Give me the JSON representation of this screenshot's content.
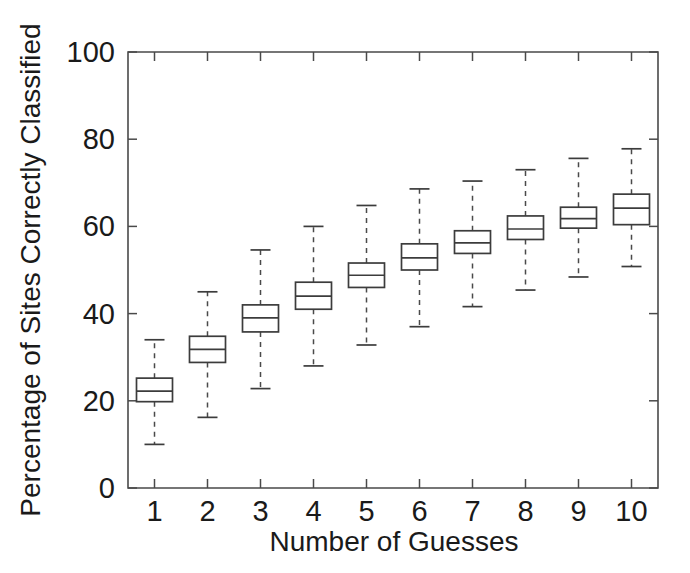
{
  "chart_data": {
    "type": "box",
    "title": "",
    "xlabel": "Number of Guesses",
    "ylabel": "Percentage of Sites Correctly Classified",
    "xlim": [
      0.5,
      10.5
    ],
    "ylim": [
      0,
      100
    ],
    "grid": false,
    "legend": "none",
    "x_tick_labels": [
      "1",
      "2",
      "3",
      "4",
      "5",
      "6",
      "7",
      "8",
      "9",
      "10"
    ],
    "y_tick_labels": [
      "0",
      "20",
      "40",
      "60",
      "80",
      "100"
    ],
    "y_ticks": [
      0,
      20,
      40,
      60,
      80,
      100
    ],
    "categories": [
      "1",
      "2",
      "3",
      "4",
      "5",
      "6",
      "7",
      "8",
      "9",
      "10"
    ],
    "boxes": [
      {
        "category": "1",
        "whisker_low": 10.0,
        "q1": 19.8,
        "median": 22.2,
        "q3": 25.2,
        "whisker_high": 34.0
      },
      {
        "category": "2",
        "whisker_low": 16.2,
        "q1": 28.8,
        "median": 31.8,
        "q3": 34.8,
        "whisker_high": 45.0
      },
      {
        "category": "3",
        "whisker_low": 22.8,
        "q1": 35.8,
        "median": 39.0,
        "q3": 42.0,
        "whisker_high": 54.6
      },
      {
        "category": "4",
        "whisker_low": 28.0,
        "q1": 41.0,
        "median": 44.0,
        "q3": 47.2,
        "whisker_high": 60.0
      },
      {
        "category": "5",
        "whisker_low": 32.8,
        "q1": 46.0,
        "median": 48.8,
        "q3": 51.6,
        "whisker_high": 64.8
      },
      {
        "category": "6",
        "whisker_low": 37.0,
        "q1": 50.0,
        "median": 52.8,
        "q3": 56.0,
        "whisker_high": 68.6
      },
      {
        "category": "7",
        "whisker_low": 41.6,
        "q1": 53.8,
        "median": 56.2,
        "q3": 59.0,
        "whisker_high": 70.4
      },
      {
        "category": "8",
        "whisker_low": 45.4,
        "q1": 57.0,
        "median": 59.4,
        "q3": 62.4,
        "whisker_high": 73.0
      },
      {
        "category": "9",
        "whisker_low": 48.4,
        "q1": 59.6,
        "median": 61.8,
        "q3": 64.4,
        "whisker_high": 75.6
      },
      {
        "category": "10",
        "whisker_low": 50.8,
        "q1": 60.4,
        "median": 64.2,
        "q3": 67.4,
        "whisker_high": 77.8
      }
    ]
  },
  "figure": {
    "background_color": "#ffffff",
    "line_color": "#3c3c3c",
    "axis_color": "#4a4a4a"
  }
}
